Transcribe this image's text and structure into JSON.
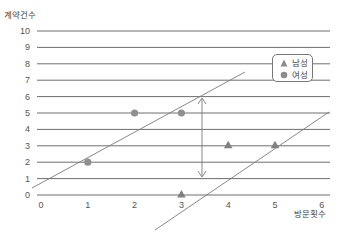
{
  "chart_data": {
    "type": "scatter",
    "title": "",
    "xlabel": "방문횟수",
    "ylabel": "계약건수",
    "xlim": [
      0,
      6
    ],
    "ylim": [
      0,
      10
    ],
    "x_ticks": [
      "0",
      "1",
      "2",
      "3",
      "4",
      "5",
      "6"
    ],
    "y_ticks": [
      "0",
      "1",
      "2",
      "3",
      "4",
      "5",
      "6",
      "7",
      "8",
      "9",
      "10"
    ],
    "grid": "horizontal",
    "legend_position": "upper right",
    "series": [
      {
        "name": "남성",
        "marker": "triangle",
        "color": "#808080",
        "points": [
          {
            "x": 3,
            "y": 0
          },
          {
            "x": 4,
            "y": 3
          },
          {
            "x": 5,
            "y": 3
          }
        ]
      },
      {
        "name": "여성",
        "marker": "circle",
        "color": "#909090",
        "points": [
          {
            "x": 1,
            "y": 2
          },
          {
            "x": 2,
            "y": 5
          },
          {
            "x": 3,
            "y": 5
          }
        ]
      }
    ],
    "annotations": [
      {
        "type": "line",
        "label": "upper boundary",
        "from": {
          "x": 0,
          "y": 0.75
        },
        "to": {
          "x": 4.35,
          "y": 7.5
        }
      },
      {
        "type": "line",
        "label": "lower boundary",
        "from": {
          "x": 2.45,
          "y": -2.1
        },
        "to": {
          "x": 6.15,
          "y": 5.1
        }
      },
      {
        "type": "double-arrow",
        "label": "margin",
        "from": {
          "x": 3.4,
          "y": 6.0
        },
        "to": {
          "x": 3.4,
          "y": 1.05
        }
      }
    ]
  },
  "axis": {
    "ylabel": "계약건수",
    "xlabel": "방문횟수",
    "y_ticks": [
      "0",
      "1",
      "2",
      "3",
      "4",
      "5",
      "6",
      "7",
      "8",
      "9",
      "10"
    ],
    "x_ticks": [
      "0",
      "1",
      "2",
      "3",
      "4",
      "5",
      "6"
    ]
  },
  "legend": {
    "items": [
      {
        "label": "남성",
        "marker": "triangle"
      },
      {
        "label": "여성",
        "marker": "circle"
      }
    ]
  },
  "colors": {
    "grid": "#6e6e6e",
    "line": "#777777",
    "marker": "#8c8c8c",
    "text": "#444444"
  }
}
